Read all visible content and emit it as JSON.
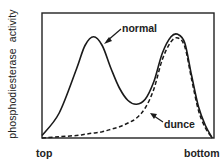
{
  "chart_data": {
    "type": "line",
    "title": "",
    "xlabel": "",
    "ylabel": "phosphodiesterase activity",
    "x_tick_labels": [
      "top",
      "bottom"
    ],
    "xlim": [
      0,
      1
    ],
    "ylim": [
      0,
      1
    ],
    "grid": false,
    "legend": "inline annotations with arrows",
    "x": [
      0.0,
      0.1,
      0.2,
      0.25,
      0.3,
      0.35,
      0.4,
      0.45,
      0.5,
      0.55,
      0.6,
      0.65,
      0.7,
      0.75,
      0.79,
      0.83,
      0.87,
      0.91,
      0.95,
      0.99
    ],
    "series": [
      {
        "name": "normal",
        "style": "solid",
        "values": [
          0.02,
          0.2,
          0.55,
          0.74,
          0.81,
          0.74,
          0.56,
          0.4,
          0.3,
          0.27,
          0.31,
          0.45,
          0.68,
          0.81,
          0.83,
          0.76,
          0.5,
          0.25,
          0.1,
          0.0
        ]
      },
      {
        "name": "dunce",
        "style": "dashed",
        "values": [
          0.0,
          0.01,
          0.02,
          0.03,
          0.04,
          0.05,
          0.07,
          0.09,
          0.12,
          0.16,
          0.24,
          0.39,
          0.63,
          0.77,
          0.8,
          0.73,
          0.47,
          0.22,
          0.08,
          0.0
        ]
      }
    ],
    "annotations": [
      {
        "text": "normal",
        "points_to": "normal",
        "at_x": 0.34
      },
      {
        "text": "dunce",
        "points_to": "dunce",
        "at_x": 0.58
      }
    ]
  },
  "labels": {
    "ylabel": "phosphodiesterase activity",
    "x_left": "top",
    "x_right": "bottom",
    "normal": "normal",
    "dunce": "dunce"
  }
}
